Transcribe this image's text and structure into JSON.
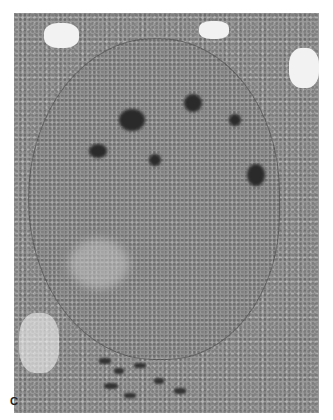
{
  "image": {
    "type": "transmission electron micrograph",
    "subject": "cell nucleus with condensed chromatin clumps",
    "panel_label": "C"
  }
}
